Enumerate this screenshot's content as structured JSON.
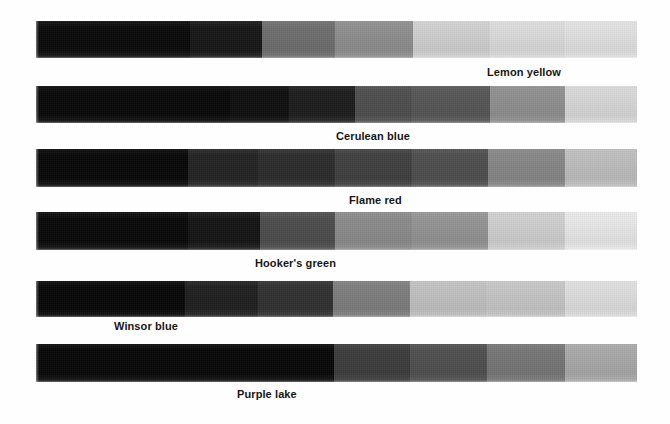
{
  "page": {
    "background_color": "#fefefe",
    "width": 670,
    "height": 424
  },
  "chart_data": {
    "type": "heatmap",
    "subtitle": "",
    "xlabel": "",
    "ylabel": "",
    "orientation": "horizontal",
    "categories": [
      "Step 1",
      "Step 2",
      "Step 3",
      "Step 4",
      "Step 5",
      "Step 6",
      "Step 7",
      "Step 8"
    ],
    "legend_position": "inline-below-each-row",
    "grid": false,
    "rows": [
      {
        "label": "Lemon yellow",
        "label_x": 487,
        "label_y": 66,
        "strip_x": 36,
        "strip_y": 21,
        "strip_width": 601,
        "strip_height": 37,
        "segments": [
          {
            "x": 36,
            "width": 154,
            "color": "#080808",
            "value": 3
          },
          {
            "x": 190,
            "width": 72,
            "color": "#161616",
            "value": 9
          },
          {
            "x": 262,
            "width": 73,
            "color": "#6e6e6e",
            "value": 43
          },
          {
            "x": 335,
            "width": 78,
            "color": "#8e8e8e",
            "value": 56
          },
          {
            "x": 413,
            "width": 77,
            "color": "#d2d2d2",
            "value": 82
          },
          {
            "x": 490,
            "width": 75,
            "color": "#dddddd",
            "value": 87
          },
          {
            "x": 565,
            "width": 72,
            "color": "#e3e3e3",
            "value": 89
          }
        ]
      },
      {
        "label": "Cerulean blue",
        "label_x": 336,
        "label_y": 130,
        "strip_x": 36,
        "strip_y": 86,
        "strip_width": 601,
        "strip_height": 37,
        "segments": [
          {
            "x": 36,
            "width": 194,
            "color": "#070707",
            "value": 3
          },
          {
            "x": 230,
            "width": 59,
            "color": "#0d0d0d",
            "value": 5
          },
          {
            "x": 289,
            "width": 66,
            "color": "#1c1c1c",
            "value": 11
          },
          {
            "x": 355,
            "width": 57,
            "color": "#4e4e4e",
            "value": 31
          },
          {
            "x": 412,
            "width": 78,
            "color": "#565656",
            "value": 34
          },
          {
            "x": 490,
            "width": 75,
            "color": "#909090",
            "value": 56
          },
          {
            "x": 565,
            "width": 72,
            "color": "#dadada",
            "value": 85
          }
        ]
      },
      {
        "label": "Flame red",
        "label_x": 349,
        "label_y": 194,
        "strip_x": 36,
        "strip_y": 149,
        "strip_width": 601,
        "strip_height": 38,
        "segments": [
          {
            "x": 36,
            "width": 152,
            "color": "#060606",
            "value": 2
          },
          {
            "x": 188,
            "width": 70,
            "color": "#222222",
            "value": 13
          },
          {
            "x": 258,
            "width": 77,
            "color": "#2b2b2b",
            "value": 17
          },
          {
            "x": 335,
            "width": 77,
            "color": "#3f3f3f",
            "value": 25
          },
          {
            "x": 412,
            "width": 76,
            "color": "#4e4e4e",
            "value": 31
          },
          {
            "x": 488,
            "width": 77,
            "color": "#878787",
            "value": 53
          },
          {
            "x": 565,
            "width": 72,
            "color": "#bfbfbf",
            "value": 75
          }
        ]
      },
      {
        "label": "Hooker's green",
        "label_x": 255,
        "label_y": 257,
        "strip_x": 36,
        "strip_y": 212,
        "strip_width": 601,
        "strip_height": 38,
        "segments": [
          {
            "x": 36,
            "width": 152,
            "color": "#070707",
            "value": 3
          },
          {
            "x": 188,
            "width": 72,
            "color": "#131313",
            "value": 8
          },
          {
            "x": 260,
            "width": 75,
            "color": "#4c4c4c",
            "value": 30
          },
          {
            "x": 335,
            "width": 77,
            "color": "#8b8b8b",
            "value": 55
          },
          {
            "x": 412,
            "width": 76,
            "color": "#949494",
            "value": 58
          },
          {
            "x": 488,
            "width": 77,
            "color": "#d0d0d0",
            "value": 82
          },
          {
            "x": 565,
            "width": 72,
            "color": "#eaeaea",
            "value": 92
          }
        ]
      },
      {
        "label": "Winsor blue",
        "label_x": 114,
        "label_y": 320,
        "strip_x": 36,
        "strip_y": 281,
        "strip_width": 601,
        "strip_height": 36,
        "segments": [
          {
            "x": 36,
            "width": 149,
            "color": "#050505",
            "value": 2
          },
          {
            "x": 185,
            "width": 73,
            "color": "#1e1e1e",
            "value": 12
          },
          {
            "x": 258,
            "width": 75,
            "color": "#303030",
            "value": 19
          },
          {
            "x": 333,
            "width": 77,
            "color": "#7e7e7e",
            "value": 49
          },
          {
            "x": 410,
            "width": 77,
            "color": "#c2c2c2",
            "value": 76
          },
          {
            "x": 487,
            "width": 78,
            "color": "#c7c7c7",
            "value": 78
          },
          {
            "x": 565,
            "width": 72,
            "color": "#e0e0e0",
            "value": 88
          }
        ]
      },
      {
        "label": "Purple lake",
        "label_x": 237,
        "label_y": 388,
        "strip_x": 36,
        "strip_y": 344,
        "strip_width": 601,
        "strip_height": 38,
        "segments": [
          {
            "x": 36,
            "width": 298,
            "color": "#060606",
            "value": 2
          },
          {
            "x": 334,
            "width": 76,
            "color": "#3b3b3b",
            "value": 23
          },
          {
            "x": 410,
            "width": 77,
            "color": "#4f4f4f",
            "value": 31
          },
          {
            "x": 487,
            "width": 78,
            "color": "#767676",
            "value": 46
          },
          {
            "x": 565,
            "width": 72,
            "color": "#a9a9a9",
            "value": 66
          }
        ]
      }
    ]
  }
}
